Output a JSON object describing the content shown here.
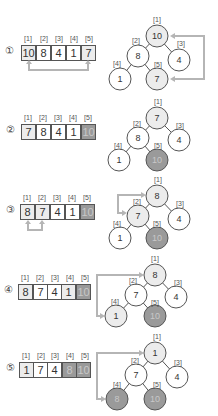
{
  "colors": {
    "highlight": "#ececec",
    "sorted": "#9a9a9a",
    "arrow": "#b5b5b5",
    "border": "#555555"
  },
  "index_labels": [
    "[1]",
    "[2]",
    "[3]",
    "[4]",
    "[5]"
  ],
  "steps": [
    {
      "marker": "①",
      "array": [
        "10",
        "8",
        "4",
        "1",
        "7"
      ],
      "states": [
        "hl",
        "",
        "",
        "",
        "hl"
      ],
      "tree": [
        "10",
        "8",
        "4",
        "1",
        "7"
      ],
      "tree_states": [
        "hl",
        "",
        "",
        "",
        "hl"
      ],
      "arrow": "swap [1] and [5]"
    },
    {
      "marker": "②",
      "array": [
        "7",
        "8",
        "4",
        "1",
        "10"
      ],
      "states": [
        "hl",
        "",
        "",
        "",
        "done"
      ],
      "tree": [
        "7",
        "8",
        "4",
        "1",
        "10"
      ],
      "tree_states": [
        "hl",
        "",
        "",
        "",
        "done"
      ],
      "arrow": ""
    },
    {
      "marker": "③",
      "array": [
        "8",
        "7",
        "4",
        "1",
        "10"
      ],
      "states": [
        "hl",
        "hl",
        "",
        "",
        "done"
      ],
      "tree": [
        "8",
        "7",
        "4",
        "1",
        "10"
      ],
      "tree_states": [
        "hl",
        "hl",
        "",
        "",
        "done"
      ],
      "arrow": "swap [1] and [2]"
    },
    {
      "marker": "④",
      "array": [
        "8",
        "7",
        "4",
        "1",
        "10"
      ],
      "states": [
        "hl",
        "",
        "",
        "hl",
        "done"
      ],
      "tree": [
        "8",
        "7",
        "4",
        "1",
        "10"
      ],
      "tree_states": [
        "hl",
        "",
        "",
        "hl",
        "done"
      ],
      "arrow": "swap [1] and [4]"
    },
    {
      "marker": "⑤",
      "array": [
        "1",
        "7",
        "4",
        "8",
        "10"
      ],
      "states": [
        "hl",
        "",
        "",
        "done",
        "done"
      ],
      "tree": [
        "1",
        "7",
        "4",
        "8",
        "10"
      ],
      "tree_states": [
        "hl",
        "",
        "",
        "done",
        "done"
      ],
      "arrow": ""
    }
  ]
}
